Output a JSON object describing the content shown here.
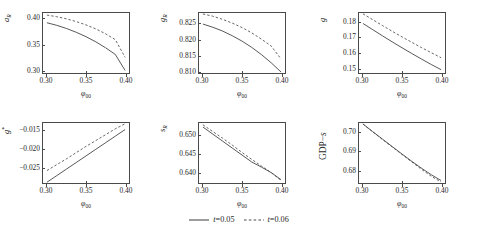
{
  "figure": {
    "panel_count": 6,
    "x_axis_title": "φ",
    "x_axis_subscript": "00"
  },
  "legend": {
    "position": "bottom-center",
    "entries": [
      {
        "label": "t=0.05",
        "style": "solid",
        "color": "#3a3a3a"
      },
      {
        "label": "t=0.06",
        "style": "dashed",
        "color": "#4a4a4a"
      }
    ]
  },
  "chart_data": [
    {
      "type": "line",
      "title": "",
      "xlabel": "φ₀₀",
      "ylabel": "a_R",
      "ylabel_base": "a",
      "ylabel_sub": "R",
      "xlim": [
        0.295,
        0.405
      ],
      "ylim": [
        0.295,
        0.412
      ],
      "xticks": [
        0.3,
        0.35,
        0.4
      ],
      "xtick_labels": [
        "0.30",
        "0.35",
        "0.40"
      ],
      "yticks": [
        0.3,
        0.35,
        0.4
      ],
      "ytick_labels": [
        "0.30",
        "0.35",
        "0.40"
      ],
      "grid": false,
      "x": [
        0.3,
        0.3125,
        0.325,
        0.3375,
        0.35,
        0.3625,
        0.375,
        0.3875,
        0.4
      ],
      "series": [
        {
          "name": "t=0.05",
          "style": "solid",
          "values": [
            0.393,
            0.388,
            0.3818,
            0.3744,
            0.3658,
            0.3558,
            0.3443,
            0.3312,
            0.3
          ]
        },
        {
          "name": "t=0.06",
          "style": "dashed",
          "values": [
            0.408,
            0.4048,
            0.4006,
            0.3953,
            0.3888,
            0.381,
            0.3715,
            0.36,
            0.3255
          ]
        }
      ]
    },
    {
      "type": "line",
      "title": "",
      "xlabel": "φ₀₀",
      "ylabel": "g_R",
      "ylabel_base": "g",
      "ylabel_sub": "R",
      "xlim": [
        0.295,
        0.405
      ],
      "ylim": [
        0.8095,
        0.8285
      ],
      "xticks": [
        0.3,
        0.35,
        0.4
      ],
      "xtick_labels": [
        "0.30",
        "0.35",
        "0.40"
      ],
      "yticks": [
        0.81,
        0.815,
        0.82,
        0.825
      ],
      "ytick_labels": [
        "0.810",
        "0.815",
        "0.820",
        "0.825"
      ],
      "grid": false,
      "x": [
        0.3,
        0.3125,
        0.325,
        0.3375,
        0.35,
        0.3625,
        0.375,
        0.3875,
        0.4
      ],
      "series": [
        {
          "name": "t=0.05",
          "style": "solid",
          "values": [
            0.825,
            0.824,
            0.8228,
            0.8213,
            0.8196,
            0.8176,
            0.8153,
            0.8127,
            0.8098
          ]
        },
        {
          "name": "t=0.06",
          "style": "dashed",
          "values": [
            0.8282,
            0.8275,
            0.8265,
            0.8253,
            0.8239,
            0.8222,
            0.8202,
            0.818,
            0.8139
          ]
        }
      ]
    },
    {
      "type": "line",
      "title": "",
      "xlabel": "φ₀₀",
      "ylabel": "g",
      "ylabel_base": "g",
      "ylabel_sub": "",
      "xlim": [
        0.295,
        0.405
      ],
      "ylim": [
        0.1465,
        0.1862
      ],
      "xticks": [
        0.3,
        0.35,
        0.4
      ],
      "xtick_labels": [
        "0.30",
        "0.35",
        "0.40"
      ],
      "yticks": [
        0.15,
        0.16,
        0.17,
        0.18
      ],
      "ytick_labels": [
        "0.15",
        "0.16",
        "0.17",
        "0.18"
      ],
      "grid": false,
      "x": [
        0.3,
        0.3125,
        0.325,
        0.3375,
        0.35,
        0.3625,
        0.375,
        0.3875,
        0.4
      ],
      "series": [
        {
          "name": "t=0.05",
          "style": "solid",
          "values": [
            0.1793,
            0.1752,
            0.1711,
            0.1671,
            0.1632,
            0.1594,
            0.1557,
            0.1521,
            0.1487
          ]
        },
        {
          "name": "t=0.06",
          "style": "dashed",
          "values": [
            0.1857,
            0.1818,
            0.1779,
            0.1741,
            0.1704,
            0.1668,
            0.1633,
            0.1599,
            0.1566
          ]
        }
      ]
    },
    {
      "type": "line",
      "title": "",
      "xlabel": "φ₀₀",
      "ylabel": "g*",
      "ylabel_base": "g",
      "ylabel_sup": "*",
      "xlim": [
        0.295,
        0.405
      ],
      "ylim": [
        -0.0292,
        -0.0128
      ],
      "xticks": [
        0.3,
        0.35,
        0.4
      ],
      "xtick_labels": [
        "0.30",
        "0.35",
        "0.40"
      ],
      "yticks": [
        -0.025,
        -0.02,
        -0.015
      ],
      "ytick_labels": [
        "−0.025",
        "−0.020",
        "−0.015"
      ],
      "grid": false,
      "x": [
        0.3,
        0.3125,
        0.325,
        0.3375,
        0.35,
        0.3625,
        0.375,
        0.3875,
        0.4
      ],
      "series": [
        {
          "name": "t=0.05",
          "style": "solid",
          "values": [
            -0.029,
            -0.0272,
            -0.0254,
            -0.0236,
            -0.0218,
            -0.02,
            -0.0182,
            -0.0164,
            -0.0146
          ]
        },
        {
          "name": "t=0.06",
          "style": "dashed",
          "values": [
            -0.0258,
            -0.0242,
            -0.0226,
            -0.0209,
            -0.0192,
            -0.0176,
            -0.016,
            -0.0144,
            -0.013
          ]
        }
      ]
    },
    {
      "type": "line",
      "title": "",
      "xlabel": "φ₀₀",
      "ylabel": "s_R",
      "ylabel_base": "s",
      "ylabel_sub": "R",
      "xlim": [
        0.295,
        0.405
      ],
      "ylim": [
        0.6372,
        0.6535
      ],
      "xticks": [
        0.3,
        0.35,
        0.4
      ],
      "xtick_labels": [
        "0.30",
        "0.35",
        "0.40"
      ],
      "yticks": [
        0.64,
        0.645,
        0.65
      ],
      "ytick_labels": [
        "0.640",
        "0.645",
        "0.650"
      ],
      "grid": false,
      "x": [
        0.3,
        0.3125,
        0.325,
        0.3375,
        0.35,
        0.3625,
        0.375,
        0.3875,
        0.4
      ],
      "series": [
        {
          "name": "t=0.05",
          "style": "solid",
          "values": [
            0.6524,
            0.6505,
            0.6486,
            0.6467,
            0.6448,
            0.6429,
            0.6415,
            0.64,
            0.6381
          ]
        },
        {
          "name": "t=0.06",
          "style": "dashed",
          "values": [
            0.653,
            0.6512,
            0.6494,
            0.6475,
            0.6455,
            0.6436,
            0.6418,
            0.64,
            0.6379
          ]
        }
      ]
    },
    {
      "type": "line",
      "title": "",
      "xlabel": "φ₀₀",
      "ylabel": "GDP−s",
      "ylabel_base": "GDP−",
      "ylabel_italic_tail": "s",
      "xlim": [
        0.295,
        0.405
      ],
      "ylim": [
        0.6735,
        0.7048
      ],
      "xticks": [
        0.3,
        0.35,
        0.4
      ],
      "xtick_labels": [
        "0.30",
        "0.35",
        "0.40"
      ],
      "yticks": [
        0.68,
        0.69,
        0.7
      ],
      "ytick_labels": [
        "0.68",
        "0.69",
        "0.70"
      ],
      "grid": false,
      "x": [
        0.3,
        0.3125,
        0.325,
        0.3375,
        0.35,
        0.3625,
        0.375,
        0.3875,
        0.4
      ],
      "series": [
        {
          "name": "t=0.05",
          "style": "solid",
          "values": [
            0.7043,
            0.7003,
            0.6964,
            0.6925,
            0.6886,
            0.6848,
            0.6812,
            0.6778,
            0.6748
          ]
        },
        {
          "name": "t=0.06",
          "style": "dashed",
          "values": [
            0.7043,
            0.7002,
            0.6962,
            0.6923,
            0.6884,
            0.6845,
            0.6806,
            0.677,
            0.674
          ]
        }
      ]
    }
  ]
}
